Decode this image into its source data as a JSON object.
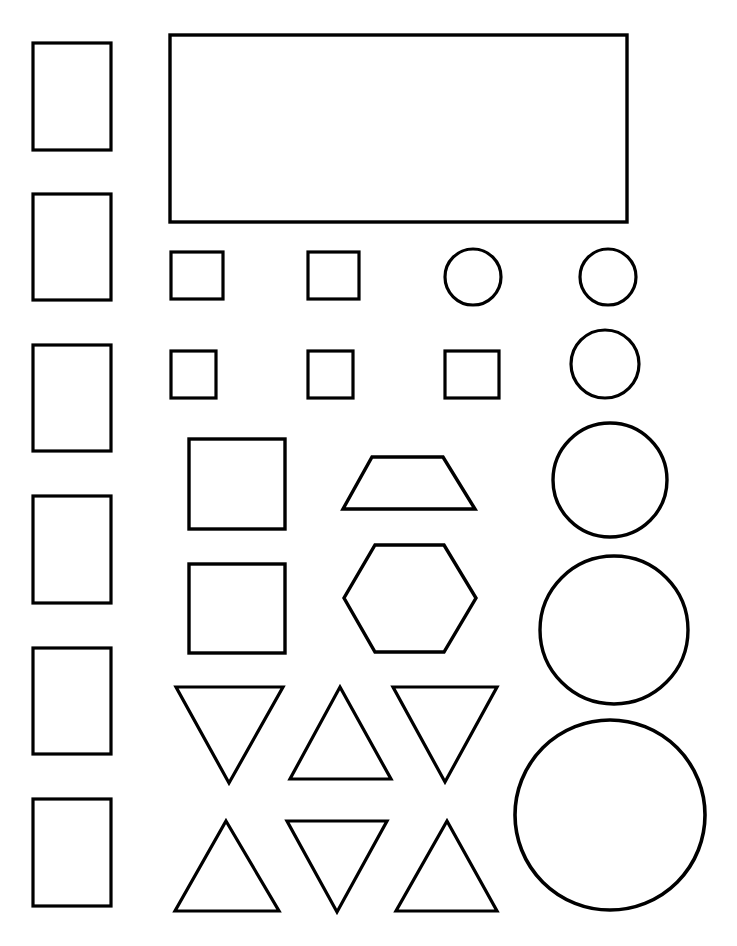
{
  "page": {
    "width": 737,
    "height": 946,
    "background_color": "#ffffff",
    "stroke_color": "#000000",
    "fill_color": "none"
  },
  "shapes": [
    {
      "name": "rect-left-1",
      "kind": "rect",
      "x": 33,
      "y": 43,
      "w": 78,
      "h": 107,
      "stroke": 3.2
    },
    {
      "name": "rect-left-2",
      "kind": "rect",
      "x": 33,
      "y": 194,
      "w": 78,
      "h": 106,
      "stroke": 3.2
    },
    {
      "name": "rect-left-3",
      "kind": "rect",
      "x": 33,
      "y": 345,
      "w": 78,
      "h": 106,
      "stroke": 3.2
    },
    {
      "name": "rect-left-4",
      "kind": "rect",
      "x": 33,
      "y": 496,
      "w": 78,
      "h": 107,
      "stroke": 3.2
    },
    {
      "name": "rect-left-5",
      "kind": "rect",
      "x": 33,
      "y": 648,
      "w": 78,
      "h": 106,
      "stroke": 3.2
    },
    {
      "name": "rect-left-6",
      "kind": "rect",
      "x": 33,
      "y": 799,
      "w": 78,
      "h": 107,
      "stroke": 3.2
    },
    {
      "name": "rect-banner",
      "kind": "rect",
      "x": 170,
      "y": 35,
      "w": 457,
      "h": 187,
      "stroke": 3.4
    },
    {
      "name": "square-small-1",
      "kind": "rect",
      "x": 171,
      "y": 252,
      "w": 52,
      "h": 47,
      "stroke": 3.2
    },
    {
      "name": "square-small-2",
      "kind": "rect",
      "x": 308,
      "y": 252,
      "w": 51,
      "h": 47,
      "stroke": 3.2
    },
    {
      "name": "square-small-3",
      "kind": "rect",
      "x": 171,
      "y": 351,
      "w": 45,
      "h": 47,
      "stroke": 3.2
    },
    {
      "name": "square-small-4",
      "kind": "rect",
      "x": 308,
      "y": 351,
      "w": 45,
      "h": 47,
      "stroke": 3.2
    },
    {
      "name": "square-small-5",
      "kind": "rect",
      "x": 445,
      "y": 351,
      "w": 54,
      "h": 47,
      "stroke": 3.2
    },
    {
      "name": "square-large-1",
      "kind": "rect",
      "x": 189,
      "y": 439,
      "w": 96,
      "h": 90,
      "stroke": 3.4
    },
    {
      "name": "square-large-2",
      "kind": "rect",
      "x": 189,
      "y": 564,
      "w": 96,
      "h": 89,
      "stroke": 3.4
    },
    {
      "name": "circle-1",
      "kind": "circle",
      "cx": 473,
      "cy": 277,
      "r": 28,
      "stroke": 3.2
    },
    {
      "name": "circle-2",
      "kind": "circle",
      "cx": 608,
      "cy": 277,
      "r": 28,
      "stroke": 3.2
    },
    {
      "name": "circle-3",
      "kind": "circle",
      "cx": 605,
      "cy": 364,
      "r": 34,
      "stroke": 3.2
    },
    {
      "name": "circle-4",
      "kind": "circle",
      "cx": 610,
      "cy": 480,
      "r": 57,
      "stroke": 3.4
    },
    {
      "name": "circle-5",
      "kind": "circle",
      "cx": 614,
      "cy": 630,
      "r": 74,
      "stroke": 3.4
    },
    {
      "name": "circle-6",
      "kind": "circle",
      "cx": 610,
      "cy": 815,
      "r": 95,
      "stroke": 3.6
    },
    {
      "name": "trapezoid",
      "kind": "polygon",
      "points": "372,457 443,457 475,509 343,509",
      "stroke": 3.4
    },
    {
      "name": "hexagon",
      "kind": "polygon",
      "points": "375,545 444,545 476,598 444,652 375,652 344,598",
      "stroke": 3.4
    },
    {
      "name": "triangle-down-1",
      "kind": "polygon",
      "points": "176,687 283,687 229,783",
      "stroke": 3.2
    },
    {
      "name": "triangle-up-1",
      "kind": "polygon",
      "points": "340,687 391,779 290,779",
      "stroke": 3.2
    },
    {
      "name": "triangle-down-2",
      "kind": "polygon",
      "points": "393,687 497,687 445,782",
      "stroke": 3.2
    },
    {
      "name": "triangle-up-2",
      "kind": "polygon",
      "points": "226,821 279,911 175,911",
      "stroke": 3.2
    },
    {
      "name": "triangle-down-3",
      "kind": "polygon",
      "points": "287,821 387,821 337,912",
      "stroke": 3.2
    },
    {
      "name": "triangle-up-3",
      "kind": "polygon",
      "points": "447,821 497,911 396,911",
      "stroke": 3.2
    }
  ]
}
